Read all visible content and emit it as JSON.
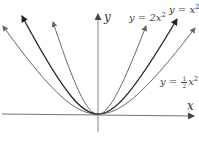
{
  "diagram": {
    "title": "",
    "axes": {
      "x_label": "x",
      "y_label": "y"
    },
    "curves": [
      {
        "name": "y = 2x^2",
        "label_prefix": "y = 2x",
        "exponent": "2",
        "coefficient": 2,
        "color": "#666666"
      },
      {
        "name": "y = x^2",
        "label_prefix": "y = x",
        "exponent": "2",
        "coefficient": 1,
        "color": "#222222"
      },
      {
        "name": "y = 1/2 x^2",
        "label_prefix": "y = ",
        "fraction_num": "1",
        "fraction_den": "2",
        "label_suffix": "x",
        "exponent": "2",
        "coefficient": 0.5,
        "color": "#666666"
      }
    ],
    "colors": {
      "axis": "#777777",
      "background": "#ffffff",
      "text": "#444444"
    }
  }
}
